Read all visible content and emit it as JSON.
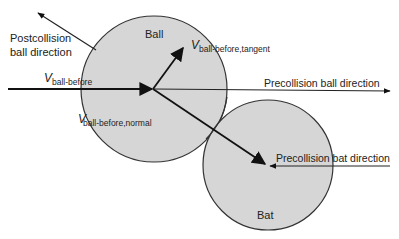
{
  "diagram": {
    "type": "collision-diagram",
    "colors": {
      "circle_fill": "#d6d6d6",
      "stroke": "#222222",
      "background": "#ffffff"
    },
    "bodies": [
      {
        "id": "ball",
        "label": "Ball",
        "cx": 154,
        "cy": 89,
        "r": 73
      },
      {
        "id": "bat",
        "label": "Bat",
        "cx": 268,
        "cy": 165,
        "r": 65
      }
    ],
    "labels": {
      "postcollision": [
        "Postcollision",
        "ball direction"
      ],
      "v_symbol": "V",
      "v_ball_before_sub": "ball-before",
      "v_tangent_sub": "ball-before,tangent",
      "v_normal_sub": "ball-before,normal",
      "precollision_ball": "Precollision ball direction",
      "precollision_bat": "Precollision bat direction",
      "ball": "Ball",
      "bat": "Bat"
    },
    "arrows": [
      {
        "name": "postcollision-ball-direction",
        "from": [
          96,
          50
        ],
        "to": [
          38,
          13
        ]
      },
      {
        "name": "v-ball-before",
        "from": [
          8,
          89
        ],
        "to": [
          153,
          89
        ]
      },
      {
        "name": "precollision-ball-direction",
        "from": [
          153,
          89
        ],
        "to": [
          390,
          91
        ]
      },
      {
        "name": "v-tangent",
        "from": [
          153,
          89
        ],
        "to": [
          183,
          49
        ]
      },
      {
        "name": "v-normal",
        "from": [
          153,
          89
        ],
        "to": [
          265,
          164
        ]
      },
      {
        "name": "precollision-bat-direction",
        "from": [
          390,
          166
        ],
        "to": [
          270,
          166
        ]
      }
    ]
  }
}
